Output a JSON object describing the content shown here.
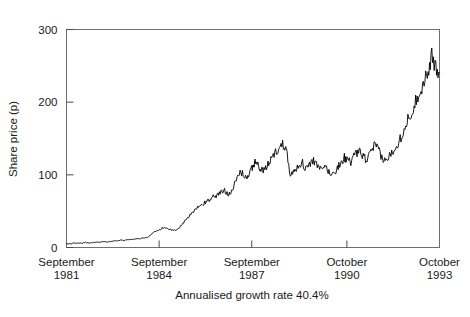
{
  "chart_data": {
    "type": "line",
    "title": "",
    "xlabel": "",
    "ylabel": "Share price (p)",
    "caption": "Annualised growth rate 40.4%",
    "ylim": [
      0,
      300
    ],
    "yticks": [
      0,
      100,
      200,
      300
    ],
    "ytick_labels": [
      "0",
      "100",
      "200",
      "300"
    ],
    "grid": false,
    "legend": "none",
    "xlim": [
      1981.71,
      1993.79
    ],
    "xticks": [
      1981.71,
      1984.71,
      1987.71,
      1990.79,
      1993.79
    ],
    "xtick_labels": [
      {
        "line1": "September",
        "line2": "1981"
      },
      {
        "line1": "September",
        "line2": "1984"
      },
      {
        "line1": "September",
        "line2": "1987"
      },
      {
        "line1": "October",
        "line2": "1990"
      },
      {
        "line1": "October",
        "line2": "1993"
      }
    ],
    "series": [
      {
        "name": "Share price",
        "color": "#000000",
        "x": [
          1981.71,
          1981.83,
          1981.96,
          1982.08,
          1982.21,
          1982.33,
          1982.46,
          1982.58,
          1982.71,
          1982.83,
          1982.96,
          1983.08,
          1983.21,
          1983.33,
          1983.46,
          1983.58,
          1983.71,
          1983.83,
          1983.96,
          1984.08,
          1984.21,
          1984.33,
          1984.46,
          1984.58,
          1984.71,
          1984.83,
          1984.96,
          1985.08,
          1985.21,
          1985.33,
          1985.46,
          1985.58,
          1985.71,
          1985.83,
          1985.96,
          1986.08,
          1986.21,
          1986.33,
          1986.46,
          1986.58,
          1986.71,
          1986.83,
          1986.96,
          1987.08,
          1987.21,
          1987.33,
          1987.46,
          1987.58,
          1987.71,
          1987.79,
          1987.83,
          1987.96,
          1988.08,
          1988.21,
          1988.33,
          1988.46,
          1988.58,
          1988.71,
          1988.83,
          1988.96,
          1989.08,
          1989.21,
          1989.33,
          1989.46,
          1989.58,
          1989.71,
          1989.83,
          1989.96,
          1990.08,
          1990.21,
          1990.33,
          1990.46,
          1990.58,
          1990.71,
          1990.79,
          1990.92,
          1991.04,
          1991.17,
          1991.29,
          1991.42,
          1991.54,
          1991.67,
          1991.79,
          1991.92,
          1992.04,
          1992.17,
          1992.29,
          1992.42,
          1992.54,
          1992.67,
          1992.79,
          1992.92,
          1993.04,
          1993.17,
          1993.29,
          1993.42,
          1993.54,
          1993.67,
          1993.79
        ],
        "y": [
          5,
          5,
          6,
          6,
          6,
          7,
          6,
          7,
          7,
          8,
          8,
          8,
          9,
          9,
          10,
          10,
          11,
          11,
          12,
          12,
          13,
          14,
          18,
          22,
          24,
          27,
          26,
          25,
          24,
          26,
          32,
          38,
          44,
          50,
          55,
          58,
          62,
          66,
          70,
          72,
          76,
          78,
          74,
          80,
          92,
          104,
          100,
          96,
          108,
          116,
          118,
          110,
          104,
          112,
          122,
          130,
          136,
          142,
          138,
          100,
          104,
          112,
          118,
          108,
          114,
          120,
          112,
          106,
          112,
          104,
          100,
          108,
          116,
          124,
          120,
          118,
          126,
          132,
          128,
          120,
          128,
          140,
          136,
          124,
          118,
          126,
          134,
          142,
          152,
          166,
          178,
          190,
          204,
          216,
          228,
          244,
          262,
          248,
          240
        ],
        "peak_value": 275,
        "final_value": 240,
        "start_value": 5
      }
    ]
  }
}
